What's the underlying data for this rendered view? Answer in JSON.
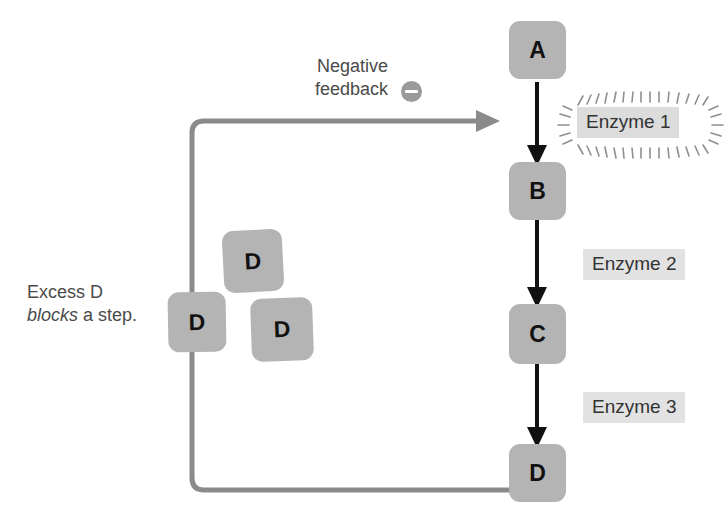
{
  "diagram": {
    "colors": {
      "metabolite_box": "#b4b4b4",
      "enzyme_label_bg": "#e2e2e2",
      "feedback_line": "#8a8a8a",
      "reaction_arrow": "#111111",
      "annotation_text": "#4a4a4a",
      "minus_badge": "#9a9a9a"
    },
    "pathway": {
      "metabolites": [
        {
          "label": "A",
          "name": "metabolite-a"
        },
        {
          "label": "B",
          "name": "metabolite-b"
        },
        {
          "label": "C",
          "name": "metabolite-c"
        },
        {
          "label": "D",
          "name": "metabolite-d"
        }
      ],
      "enzymes": [
        {
          "label": "Enzyme 1",
          "inhibited": "true"
        },
        {
          "label": "Enzyme 2",
          "inhibited": "false"
        },
        {
          "label": "Enzyme 3",
          "inhibited": "false"
        }
      ]
    },
    "excess_product": {
      "boxes": [
        {
          "label": "D"
        },
        {
          "label": "D"
        },
        {
          "label": "D"
        }
      ]
    },
    "annotations": {
      "negative_feedback_line1": "Negative",
      "negative_feedback_line2": "feedback",
      "minus_symbol": "−",
      "excess_line1": "Excess D",
      "excess_emphasis": "blocks",
      "excess_line2_rest": " a step."
    }
  }
}
